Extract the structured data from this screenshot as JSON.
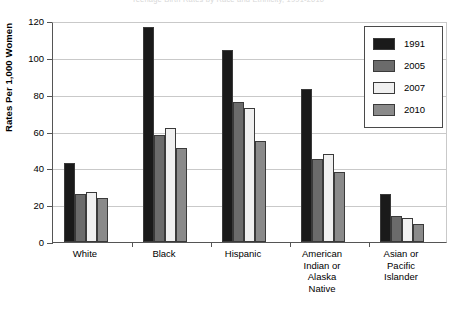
{
  "figure": {
    "cut_off_header": "Teenage Birth Rates by Race and Ethnicity, 1991-2010"
  },
  "chart_data": {
    "type": "bar",
    "title": "",
    "xlabel": "",
    "ylabel": "Rates Per 1,000 Women",
    "ylim": [
      0,
      120
    ],
    "ytick_step": 20,
    "ytick_labels": [
      "0",
      "20",
      "40",
      "60",
      "80",
      "100",
      "120"
    ],
    "grid": true,
    "legend_position": "top-right",
    "categories": [
      "White",
      "Black",
      "Hispanic",
      "American\nIndian or\nAlaska\nNative",
      "Asian or\nPacific\nIslander"
    ],
    "series": [
      {
        "name": "1991",
        "color": "#1a1a1a",
        "values": [
          43,
          117,
          104,
          83,
          26
        ]
      },
      {
        "name": "2005",
        "color": "#6b6b6b",
        "values": [
          26,
          58,
          76,
          45,
          14
        ]
      },
      {
        "name": "2007",
        "color": "#f0f0f0",
        "values": [
          27,
          62,
          73,
          48,
          13
        ]
      },
      {
        "name": "2010",
        "color": "#8a8a8a",
        "values": [
          24,
          51,
          55,
          38,
          10
        ]
      }
    ]
  }
}
